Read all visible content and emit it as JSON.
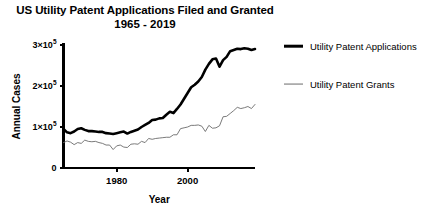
{
  "chart_data": {
    "type": "line",
    "title": "US Utility Patent Applications Filed and Granted",
    "subtitle": "1965 - 2019",
    "xlabel": "Year",
    "ylabel": "Annual Cases",
    "xlim": [
      1965,
      2019
    ],
    "ylim": [
      0,
      300000
    ],
    "grid": false,
    "legend_position": "right",
    "xticks": [
      1980,
      2000
    ],
    "xtick_labels": [
      "1980",
      "2000"
    ],
    "yticks": [
      0,
      100000,
      200000,
      300000
    ],
    "ytick_labels": [
      "0",
      "1×10⁵",
      "2×10⁵",
      "3×10⁵"
    ],
    "ytick_parts": [
      {
        "mantissa": "0",
        "exponent": ""
      },
      {
        "mantissa": "1×10",
        "exponent": "5"
      },
      {
        "mantissa": "2×10",
        "exponent": "5"
      },
      {
        "mantissa": "3×10",
        "exponent": "5"
      }
    ],
    "x": [
      1965,
      1966,
      1967,
      1968,
      1969,
      1970,
      1971,
      1972,
      1973,
      1974,
      1975,
      1976,
      1977,
      1978,
      1979,
      1980,
      1981,
      1982,
      1983,
      1984,
      1985,
      1986,
      1987,
      1988,
      1989,
      1990,
      1991,
      1992,
      1993,
      1994,
      1995,
      1996,
      1997,
      1998,
      1999,
      2000,
      2001,
      2002,
      2003,
      2004,
      2005,
      2006,
      2007,
      2008,
      2009,
      2010,
      2011,
      2012,
      2013,
      2014,
      2015,
      2016,
      2017,
      2018,
      2019
    ],
    "series": [
      {
        "name": "Utility Patent Applications",
        "color": "#000000",
        "line_width": 2.6,
        "values": [
          94200,
          85100,
          84300,
          89400,
          96900,
          102300,
          99000,
          97600,
          98700,
          97500,
          98600,
          98700,
          98500,
          99100,
          98600,
          104300,
          113000,
          117900,
          103700,
          113900,
          117000,
          122400,
          133000,
          139800,
          152700,
          164600,
          164300,
          173100,
          174700,
          189700,
          212400,
          195200,
          220800,
          240100,
          270000,
          295900,
          326500,
          334400,
          342400,
          356900,
          390700,
          425900,
          456100,
          456300,
          456100,
          490200,
          503600,
          542800,
          571600,
          578800,
          589400,
          605600,
          607800,
          597100,
          621500
        ]
      },
      {
        "name": "Utility Patent Grants",
        "color": "#6b6b6b",
        "line_width": 0.9,
        "values": [
          62900,
          68400,
          65700,
          59100,
          67500,
          64400,
          78300,
          74800,
          74100,
          76300,
          72000,
          70200,
          65300,
          66100,
          48800,
          61800,
          65800,
          57900,
          56900,
          67200,
          71700,
          70900,
          82900,
          77900,
          95500,
          90400,
          96500,
          97400,
          98300,
          101700,
          101400,
          109600,
          112000,
          147500,
          153500,
          157500,
          166000,
          167300,
          169000,
          164200,
          143800,
          173800,
          157300,
          157800,
          167350,
          219600,
          224500,
          253200,
          277800,
          300700,
          298400,
          304100,
          318800,
          308000,
          354400
        ]
      }
    ],
    "series_display": [
      {
        "name": "Utility Patent Applications",
        "note": "rendered at chart scale",
        "points": [
          [
            1965,
            95000
          ],
          [
            1966,
            87000
          ],
          [
            1967,
            85000
          ],
          [
            1968,
            89000
          ],
          [
            1969,
            95000
          ],
          [
            1970,
            97000
          ],
          [
            1971,
            93000
          ],
          [
            1972,
            90000
          ],
          [
            1973,
            90000
          ],
          [
            1974,
            89000
          ],
          [
            1975,
            88000
          ],
          [
            1976,
            88000
          ],
          [
            1977,
            85000
          ],
          [
            1978,
            84000
          ],
          [
            1979,
            83000
          ],
          [
            1980,
            85000
          ],
          [
            1981,
            87000
          ],
          [
            1982,
            89000
          ],
          [
            1983,
            84000
          ],
          [
            1984,
            88000
          ],
          [
            1985,
            91000
          ],
          [
            1986,
            94000
          ],
          [
            1987,
            100000
          ],
          [
            1988,
            105000
          ],
          [
            1989,
            110000
          ],
          [
            1990,
            117000
          ],
          [
            1991,
            118000
          ],
          [
            1992,
            121000
          ],
          [
            1993,
            122000
          ],
          [
            1994,
            130000
          ],
          [
            1995,
            137000
          ],
          [
            1996,
            134000
          ],
          [
            1997,
            144000
          ],
          [
            1998,
            155000
          ],
          [
            1999,
            169000
          ],
          [
            2000,
            183000
          ],
          [
            2001,
            197000
          ],
          [
            2002,
            203000
          ],
          [
            2003,
            211000
          ],
          [
            2004,
            222000
          ],
          [
            2005,
            240000
          ],
          [
            2006,
            254000
          ],
          [
            2007,
            265000
          ],
          [
            2008,
            267000
          ],
          [
            2009,
            247000
          ],
          [
            2010,
            263000
          ],
          [
            2011,
            271000
          ],
          [
            2012,
            285000
          ],
          [
            2013,
            288000
          ],
          [
            2014,
            291000
          ],
          [
            2015,
            290000
          ],
          [
            2016,
            292000
          ],
          [
            2017,
            291000
          ],
          [
            2018,
            288000
          ],
          [
            2019,
            290000
          ]
        ]
      },
      {
        "name": "Utility Patent Grants",
        "note": "rendered at chart scale",
        "points": [
          [
            1965,
            62000
          ],
          [
            1966,
            66000
          ],
          [
            1967,
            63000
          ],
          [
            1968,
            57000
          ],
          [
            1969,
            62000
          ],
          [
            1970,
            60000
          ],
          [
            1971,
            68000
          ],
          [
            1972,
            65000
          ],
          [
            1973,
            64000
          ],
          [
            1974,
            65000
          ],
          [
            1975,
            62000
          ],
          [
            1976,
            60000
          ],
          [
            1977,
            56000
          ],
          [
            1978,
            56000
          ],
          [
            1979,
            45000
          ],
          [
            1980,
            54000
          ],
          [
            1981,
            56000
          ],
          [
            1982,
            51000
          ],
          [
            1983,
            50000
          ],
          [
            1984,
            58000
          ],
          [
            1985,
            59000
          ],
          [
            1986,
            58000
          ],
          [
            1987,
            65000
          ],
          [
            1988,
            62000
          ],
          [
            1989,
            72000
          ],
          [
            1990,
            70000
          ],
          [
            1991,
            72000
          ],
          [
            1992,
            73000
          ],
          [
            1993,
            74000
          ],
          [
            1994,
            75000
          ],
          [
            1995,
            75000
          ],
          [
            1996,
            81000
          ],
          [
            1997,
            81000
          ],
          [
            1998,
            96000
          ],
          [
            1999,
            98000
          ],
          [
            2000,
            100000
          ],
          [
            2001,
            104000
          ],
          [
            2002,
            104000
          ],
          [
            2003,
            105000
          ],
          [
            2004,
            102000
          ],
          [
            2005,
            89000
          ],
          [
            2006,
            104000
          ],
          [
            2007,
            97000
          ],
          [
            2008,
            98000
          ],
          [
            2009,
            103000
          ],
          [
            2010,
            125000
          ],
          [
            2011,
            126000
          ],
          [
            2012,
            133000
          ],
          [
            2013,
            140000
          ],
          [
            2014,
            148000
          ],
          [
            2015,
            145000
          ],
          [
            2016,
            147000
          ],
          [
            2017,
            150000
          ],
          [
            2018,
            145000
          ],
          [
            2019,
            155000
          ]
        ]
      }
    ],
    "legend": [
      {
        "label": "Utility Patent Applications",
        "color": "#000000",
        "line_width": 2.6
      },
      {
        "label": "Utility Patent Grants",
        "color": "#6b6b6b",
        "line_width": 0.9
      }
    ]
  },
  "axis_colors": {
    "axis": "#000000",
    "background": "#ffffff",
    "text": "#000000"
  }
}
